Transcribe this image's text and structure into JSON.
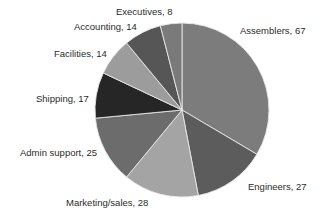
{
  "chart_data": {
    "type": "pie",
    "title": "",
    "start_angle_deg": 0,
    "direction": "clockwise",
    "categories": [
      "Assemblers",
      "Engineers",
      "Marketing/sales",
      "Admin support",
      "Shipping",
      "Facilities",
      "Accounting",
      "Executives"
    ],
    "values": [
      67,
      27,
      28,
      25,
      17,
      14,
      14,
      8
    ],
    "colors": [
      "#7c7c7c",
      "#5c5c5c",
      "#a4a4a4",
      "#6c6c6c",
      "#262626",
      "#9c9c9c",
      "#565656",
      "#7a7a7a"
    ],
    "labels": [
      "Assemblers, 67",
      "Engineers, 27",
      "Marketing/sales, 28",
      "Admin support, 25",
      "Shipping, 17",
      "Facilities, 14",
      "Accounting, 14",
      "Executives, 8"
    ],
    "total": 200,
    "legend": "none (inline data labels)"
  },
  "geometry": {
    "cx": 182,
    "cy": 110,
    "r": 87
  },
  "label_positions": [
    {
      "x": 240,
      "y": 25
    },
    {
      "x": 248,
      "y": 181
    },
    {
      "x": 66,
      "y": 197
    },
    {
      "x": 20,
      "y": 147
    },
    {
      "x": 36,
      "y": 93
    },
    {
      "x": 54,
      "y": 48
    },
    {
      "x": 74,
      "y": 21
    },
    {
      "x": 116,
      "y": 6
    }
  ]
}
